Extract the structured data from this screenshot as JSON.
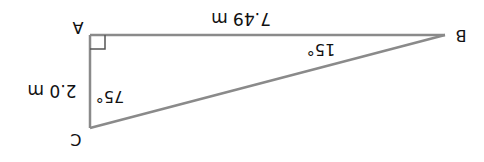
{
  "diagram": {
    "type": "right-triangle",
    "orientation": "rotated 180 degrees",
    "colors": {
      "line": "#8a8a8a",
      "text": "#111111",
      "background": "#ffffff"
    },
    "vertices": [
      {
        "label": "A",
        "angle_marker": "right-angle"
      },
      {
        "label": "B",
        "angle": "15°"
      },
      {
        "label": "C",
        "angle": "75°"
      }
    ],
    "sides": [
      {
        "between": "A-B",
        "label": "7.49 m"
      },
      {
        "between": "A-C",
        "label": "2.0 m"
      }
    ],
    "labels": {
      "A": "A",
      "B": "B",
      "C": "C",
      "side_AB": "7.49 m",
      "side_AC": "2.0 m",
      "angle_B": "15°",
      "angle_C": "75°"
    }
  }
}
